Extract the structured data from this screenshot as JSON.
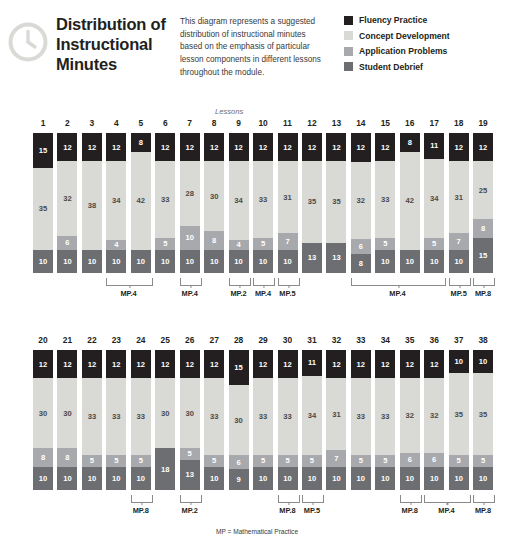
{
  "header": {
    "icon": "clock-icon",
    "title": "Distribution of Instructional Minutes",
    "description": "This diagram represents a suggested distribution of instructional minutes based on the emphasis of particular lesson components in different lessons throughout the module.",
    "legend": [
      {
        "label": "Fluency Practice",
        "color": "#231f20",
        "key": "fluency"
      },
      {
        "label": "Concept Development",
        "color": "#d9d9d6",
        "key": "concept"
      },
      {
        "label": "Application Problems",
        "color": "#a7a9ac",
        "key": "application"
      },
      {
        "label": "Student Debrief",
        "color": "#6d6e71",
        "key": "debrief"
      }
    ]
  },
  "axis_caption": "Lessons",
  "footnote": "MP = Mathematical Practice",
  "chart_data": {
    "type": "bar",
    "stacked": true,
    "title": "Distribution of Instructional Minutes",
    "xlabel": "Lessons",
    "ylabel": "Instructional Minutes",
    "series": [
      {
        "name": "Fluency Practice",
        "key": "fluency",
        "color": "#231f20"
      },
      {
        "name": "Concept Development",
        "key": "concept",
        "color": "#d9d9d6"
      },
      {
        "name": "Application Problems",
        "key": "application",
        "color": "#a7a9ac"
      },
      {
        "name": "Student Debrief",
        "key": "debrief",
        "color": "#6d6e71"
      }
    ],
    "categories": [
      1,
      2,
      3,
      4,
      5,
      6,
      7,
      8,
      9,
      10,
      11,
      12,
      13,
      14,
      15,
      16,
      17,
      18,
      19,
      20,
      21,
      22,
      23,
      24,
      25,
      26,
      27,
      28,
      29,
      30,
      31,
      32,
      33,
      34,
      35,
      36,
      37,
      38
    ],
    "lessons": [
      {
        "lesson": 1,
        "fluency": 15,
        "concept": 35,
        "application": 0,
        "debrief": 10,
        "row": 0
      },
      {
        "lesson": 2,
        "fluency": 12,
        "concept": 32,
        "application": 6,
        "debrief": 10,
        "row": 0
      },
      {
        "lesson": 3,
        "fluency": 12,
        "concept": 38,
        "application": 0,
        "debrief": 10,
        "row": 0
      },
      {
        "lesson": 4,
        "fluency": 12,
        "concept": 34,
        "application": 4,
        "debrief": 10,
        "row": 0
      },
      {
        "lesson": 5,
        "fluency": 8,
        "concept": 42,
        "application": 0,
        "debrief": 10,
        "row": 0
      },
      {
        "lesson": 6,
        "fluency": 12,
        "concept": 33,
        "application": 5,
        "debrief": 10,
        "row": 0
      },
      {
        "lesson": 7,
        "fluency": 12,
        "concept": 28,
        "application": 10,
        "debrief": 10,
        "row": 0
      },
      {
        "lesson": 8,
        "fluency": 12,
        "concept": 30,
        "application": 8,
        "debrief": 10,
        "row": 0
      },
      {
        "lesson": 9,
        "fluency": 12,
        "concept": 34,
        "application": 4,
        "debrief": 10,
        "row": 0
      },
      {
        "lesson": 10,
        "fluency": 12,
        "concept": 33,
        "application": 5,
        "debrief": 10,
        "row": 0
      },
      {
        "lesson": 11,
        "fluency": 12,
        "concept": 31,
        "application": 7,
        "debrief": 10,
        "row": 0
      },
      {
        "lesson": 12,
        "fluency": 12,
        "concept": 35,
        "application": 0,
        "debrief": 13,
        "row": 0
      },
      {
        "lesson": 13,
        "fluency": 12,
        "concept": 35,
        "application": 0,
        "debrief": 13,
        "row": 0
      },
      {
        "lesson": 14,
        "fluency": 12,
        "concept": 32,
        "application": 6,
        "debrief": 8,
        "row": 0
      },
      {
        "lesson": 15,
        "fluency": 12,
        "concept": 33,
        "application": 5,
        "debrief": 10,
        "row": 0
      },
      {
        "lesson": 16,
        "fluency": 8,
        "concept": 42,
        "application": 0,
        "debrief": 10,
        "row": 0
      },
      {
        "lesson": 17,
        "fluency": 11,
        "concept": 34,
        "application": 5,
        "debrief": 10,
        "row": 0
      },
      {
        "lesson": 18,
        "fluency": 12,
        "concept": 31,
        "application": 7,
        "debrief": 10,
        "row": 0
      },
      {
        "lesson": 19,
        "fluency": 12,
        "concept": 25,
        "application": 8,
        "debrief": 15,
        "row": 0
      },
      {
        "lesson": 20,
        "fluency": 12,
        "concept": 30,
        "application": 8,
        "debrief": 10,
        "row": 1
      },
      {
        "lesson": 21,
        "fluency": 12,
        "concept": 30,
        "application": 8,
        "debrief": 10,
        "row": 1
      },
      {
        "lesson": 22,
        "fluency": 12,
        "concept": 33,
        "application": 5,
        "debrief": 10,
        "row": 1
      },
      {
        "lesson": 23,
        "fluency": 12,
        "concept": 33,
        "application": 5,
        "debrief": 10,
        "row": 1
      },
      {
        "lesson": 24,
        "fluency": 12,
        "concept": 33,
        "application": 5,
        "debrief": 10,
        "row": 1
      },
      {
        "lesson": 25,
        "fluency": 12,
        "concept": 30,
        "application": 0,
        "debrief": 18,
        "row": 1
      },
      {
        "lesson": 26,
        "fluency": 12,
        "concept": 30,
        "application": 5,
        "debrief": 13,
        "row": 1
      },
      {
        "lesson": 27,
        "fluency": 12,
        "concept": 33,
        "application": 5,
        "debrief": 10,
        "row": 1
      },
      {
        "lesson": 28,
        "fluency": 15,
        "concept": 30,
        "application": 6,
        "debrief": 9,
        "row": 1
      },
      {
        "lesson": 29,
        "fluency": 12,
        "concept": 33,
        "application": 5,
        "debrief": 10,
        "row": 1
      },
      {
        "lesson": 30,
        "fluency": 12,
        "concept": 33,
        "application": 5,
        "debrief": 10,
        "row": 1
      },
      {
        "lesson": 31,
        "fluency": 11,
        "concept": 34,
        "application": 5,
        "debrief": 10,
        "row": 1
      },
      {
        "lesson": 32,
        "fluency": 12,
        "concept": 31,
        "application": 7,
        "debrief": 10,
        "row": 1
      },
      {
        "lesson": 33,
        "fluency": 12,
        "concept": 33,
        "application": 5,
        "debrief": 10,
        "row": 1
      },
      {
        "lesson": 34,
        "fluency": 12,
        "concept": 33,
        "application": 5,
        "debrief": 10,
        "row": 1
      },
      {
        "lesson": 35,
        "fluency": 12,
        "concept": 32,
        "application": 6,
        "debrief": 10,
        "row": 1
      },
      {
        "lesson": 36,
        "fluency": 12,
        "concept": 32,
        "application": 6,
        "debrief": 10,
        "row": 1
      },
      {
        "lesson": 37,
        "fluency": 10,
        "concept": 35,
        "application": 5,
        "debrief": 10,
        "row": 1
      },
      {
        "lesson": 38,
        "fluency": 10,
        "concept": 35,
        "application": 5,
        "debrief": 10,
        "row": 1
      }
    ],
    "brackets": [
      {
        "row": 0,
        "from": 4,
        "to": 5,
        "label": "MP.4"
      },
      {
        "row": 0,
        "from": 7,
        "to": 7,
        "label": "MP.4"
      },
      {
        "row": 0,
        "from": 9,
        "to": 9,
        "label": "MP.2"
      },
      {
        "row": 0,
        "from": 10,
        "to": 10,
        "label": "MP.4"
      },
      {
        "row": 0,
        "from": 11,
        "to": 11,
        "label": "MP.5"
      },
      {
        "row": 0,
        "from": 14,
        "to": 17,
        "label": "MP.4"
      },
      {
        "row": 0,
        "from": 18,
        "to": 18,
        "label": "MP.5"
      },
      {
        "row": 0,
        "from": 19,
        "to": 19,
        "label": "MP.8"
      },
      {
        "row": 1,
        "from": 24,
        "to": 24,
        "label": "MP.8"
      },
      {
        "row": 1,
        "from": 26,
        "to": 26,
        "label": "MP.2"
      },
      {
        "row": 1,
        "from": 30,
        "to": 30,
        "label": "MP.8"
      },
      {
        "row": 1,
        "from": 31,
        "to": 31,
        "label": "MP.5"
      },
      {
        "row": 1,
        "from": 35,
        "to": 35,
        "label": "MP.8"
      },
      {
        "row": 1,
        "from": 36,
        "to": 37,
        "label": "MP.4"
      },
      {
        "row": 1,
        "from": 38,
        "to": 38,
        "label": "MP.8"
      }
    ]
  }
}
